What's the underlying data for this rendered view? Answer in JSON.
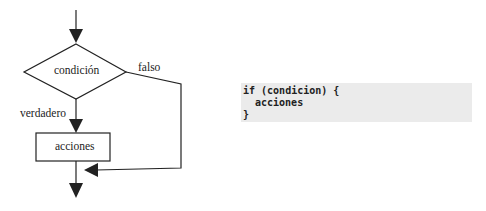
{
  "flowchart": {
    "condition_label": "condición",
    "false_label": "falso",
    "true_label": "verdadero",
    "action_label": "acciones"
  },
  "code": {
    "lines": [
      "if (condicion) {",
      "acciones",
      "}"
    ]
  },
  "colors": {
    "stroke": "#222222",
    "code_background": "#ebebeb"
  }
}
